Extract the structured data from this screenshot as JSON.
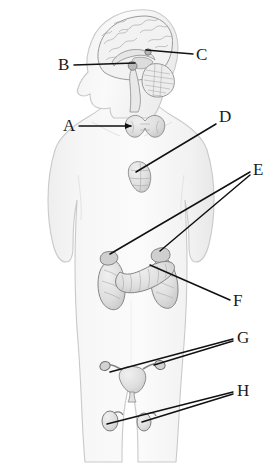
{
  "figure": {
    "background_color": "#ffffff",
    "body_fill": "#f4f4f4",
    "body_stroke": "#c8c8c8",
    "organ_fill": "#e3e3e3",
    "organ_stroke": "#8f8f8f",
    "leader_color": "#111111",
    "label_color": "#1a1a1a",
    "width": 273,
    "height": 466
  },
  "labels": [
    {
      "id": "A",
      "text": "A",
      "organ": "thyroid-gland",
      "text_x": 63,
      "text_y": 131,
      "leaders": [
        [
          79,
          126,
          131,
          126
        ]
      ],
      "arrow": true
    },
    {
      "id": "B",
      "text": "B",
      "organ": "pituitary-gland",
      "text_x": 58,
      "text_y": 70,
      "leaders": [
        [
          74,
          65,
          135,
          63
        ]
      ],
      "arrow": false
    },
    {
      "id": "C",
      "text": "C",
      "organ": "pineal-gland",
      "text_x": 196,
      "text_y": 60,
      "leaders": [
        [
          193,
          54,
          146,
          50
        ]
      ],
      "arrow": false
    },
    {
      "id": "D",
      "text": "D",
      "organ": "thymus-gland",
      "text_x": 219,
      "text_y": 122,
      "leaders": [
        [
          216,
          124,
          136,
          172
        ]
      ],
      "arrow": false
    },
    {
      "id": "E",
      "text": "E",
      "organ": "adrenal-glands",
      "text_x": 253,
      "text_y": 175,
      "leaders": [
        [
          250,
          172,
          110,
          254
        ],
        [
          250,
          175,
          160,
          251
        ]
      ],
      "arrow": false
    },
    {
      "id": "F",
      "text": "F",
      "organ": "pancreas",
      "text_x": 233,
      "text_y": 306,
      "leaders": [
        [
          230,
          300,
          150,
          265
        ]
      ],
      "arrow": false
    },
    {
      "id": "G",
      "text": "G",
      "organ": "ovaries",
      "text_x": 237,
      "text_y": 343,
      "leaders": [
        [
          233,
          339,
          110,
          372
        ],
        [
          233,
          341,
          154,
          365
        ]
      ],
      "arrow": false
    },
    {
      "id": "H",
      "text": "H",
      "organ": "testes",
      "text_x": 237,
      "text_y": 396,
      "leaders": [
        [
          233,
          392,
          107,
          424
        ],
        [
          233,
          394,
          142,
          422
        ]
      ],
      "arrow": false
    }
  ],
  "organs": [
    {
      "name": "brain-cerebrum",
      "label_id": null
    },
    {
      "name": "brain-cerebellum",
      "label_id": null
    },
    {
      "name": "corpus-callosum",
      "label_id": null
    },
    {
      "name": "brain-stem",
      "label_id": null
    },
    {
      "name": "pituitary-gland",
      "label_id": "B"
    },
    {
      "name": "pineal-gland",
      "label_id": "C"
    },
    {
      "name": "thyroid-gland",
      "label_id": "A"
    },
    {
      "name": "thymus-gland",
      "label_id": "D"
    },
    {
      "name": "adrenal-gland-left",
      "label_id": "E"
    },
    {
      "name": "adrenal-gland-right",
      "label_id": "E"
    },
    {
      "name": "kidney-left",
      "label_id": null
    },
    {
      "name": "kidney-right",
      "label_id": null
    },
    {
      "name": "pancreas",
      "label_id": "F"
    },
    {
      "name": "uterus",
      "label_id": null
    },
    {
      "name": "ovary-left",
      "label_id": "G"
    },
    {
      "name": "ovary-right",
      "label_id": "G"
    },
    {
      "name": "testis-left",
      "label_id": "H"
    },
    {
      "name": "testis-right",
      "label_id": "H"
    }
  ]
}
